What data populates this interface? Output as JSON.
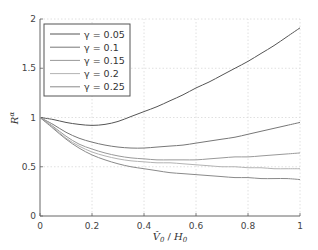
{
  "chart_data": {
    "type": "line",
    "title": "",
    "xlabel": "V̂₀ / H₀",
    "ylabel": "Rᵅ",
    "xlim": [
      0,
      1
    ],
    "ylim": [
      0,
      2
    ],
    "xticks": [
      0,
      0.2,
      0.4,
      0.6,
      0.8,
      1
    ],
    "xtick_labels": [
      "0",
      "0.2",
      "0.4",
      "0.6",
      "0.8",
      "1"
    ],
    "yticks": [
      0,
      0.5,
      1,
      1.5,
      2
    ],
    "ytick_labels": [
      "0",
      "0.5",
      "1",
      "1.5",
      "2"
    ],
    "grid": true,
    "legend_position": "upper left",
    "x": [
      0,
      0.05,
      0.1,
      0.15,
      0.2,
      0.25,
      0.3,
      0.35,
      0.4,
      0.45,
      0.5,
      0.55,
      0.6,
      0.65,
      0.7,
      0.75,
      0.8,
      0.85,
      0.9,
      0.95,
      1.0
    ],
    "series": [
      {
        "name": "γ = 0.05",
        "color": "#555555",
        "values": [
          1.0,
          0.98,
          0.95,
          0.93,
          0.92,
          0.93,
          0.96,
          1.01,
          1.06,
          1.11,
          1.17,
          1.23,
          1.3,
          1.36,
          1.43,
          1.5,
          1.57,
          1.65,
          1.73,
          1.82,
          1.91
        ]
      },
      {
        "name": "γ = 0.1",
        "color": "#777777",
        "values": [
          1.0,
          0.93,
          0.85,
          0.79,
          0.75,
          0.72,
          0.7,
          0.69,
          0.69,
          0.7,
          0.71,
          0.72,
          0.74,
          0.76,
          0.78,
          0.8,
          0.83,
          0.86,
          0.89,
          0.92,
          0.95
        ]
      },
      {
        "name": "γ = 0.15",
        "color": "#999999",
        "values": [
          1.0,
          0.91,
          0.81,
          0.73,
          0.68,
          0.64,
          0.61,
          0.59,
          0.58,
          0.57,
          0.57,
          0.57,
          0.57,
          0.58,
          0.59,
          0.6,
          0.6,
          0.61,
          0.62,
          0.63,
          0.64
        ]
      },
      {
        "name": "γ = 0.2",
        "color": "#b3b3b3",
        "values": [
          1.0,
          0.9,
          0.79,
          0.71,
          0.65,
          0.61,
          0.58,
          0.56,
          0.55,
          0.54,
          0.54,
          0.53,
          0.52,
          0.51,
          0.5,
          0.5,
          0.49,
          0.49,
          0.48,
          0.48,
          0.48
        ]
      },
      {
        "name": "γ = 0.25",
        "color": "#8a8a8a",
        "values": [
          1.0,
          0.89,
          0.78,
          0.69,
          0.62,
          0.57,
          0.53,
          0.5,
          0.48,
          0.46,
          0.44,
          0.43,
          0.42,
          0.41,
          0.4,
          0.39,
          0.39,
          0.38,
          0.38,
          0.38,
          0.37
        ]
      }
    ]
  },
  "legend": {
    "items": [
      {
        "label": "γ = 0.05"
      },
      {
        "label": "γ = 0.1"
      },
      {
        "label": "γ = 0.15"
      },
      {
        "label": "γ = 0.2"
      },
      {
        "label": "γ = 0.25"
      }
    ]
  },
  "axes": {
    "xlabel_main": "V̂",
    "xlabel_sub0": "0",
    "xlabel_sep": " / ",
    "xlabel_h": "H",
    "xlabel_sub1": "0",
    "ylabel_main": "R",
    "ylabel_sup": "α"
  }
}
